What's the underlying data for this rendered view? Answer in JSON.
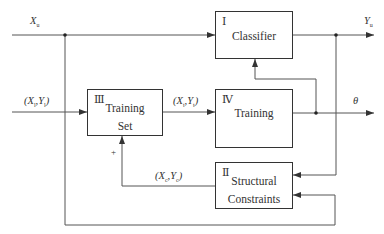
{
  "diagram": {
    "type": "block-diagram",
    "blocks": [
      {
        "id": "I",
        "numeral": "Ⅰ",
        "label": "Classifier"
      },
      {
        "id": "II",
        "numeral": "Ⅱ",
        "label_line1": "Structural",
        "label_line2": "Constraints"
      },
      {
        "id": "III",
        "numeral": "Ⅲ",
        "label_line1": "Training",
        "label_line2": "Set"
      },
      {
        "id": "IV",
        "numeral": "Ⅳ",
        "label": "Training"
      }
    ],
    "signals": {
      "input_unlabeled": {
        "base": "X",
        "sub": "u"
      },
      "input_labeled": {
        "open": "(",
        "b1": "X",
        "s1": "l",
        "sep": ",",
        "b2": "Y",
        "s2": "l",
        "close": ")"
      },
      "training_output": {
        "open": "(",
        "b1": "X",
        "s1": "t",
        "sep": ",",
        "b2": "Y",
        "s2": "t",
        "close": ")"
      },
      "constraint_output": {
        "open": "(",
        "b1": "X",
        "s1": "c",
        "sep": ",",
        "b2": "Y",
        "s2": "c",
        "close": ")"
      },
      "output_labels": {
        "base": "Y",
        "sub": "u"
      },
      "parameters": "θ",
      "feedback_sign": "+"
    },
    "edges": [
      "X_u → I",
      "X_u → II",
      "(X_l,Y_l) → III",
      "III → IV (X_t,Y_t)",
      "IV → θ",
      "θ → I",
      "I → Y_u",
      "Y_u → II",
      "II → III (X_c,Y_c) +"
    ]
  }
}
